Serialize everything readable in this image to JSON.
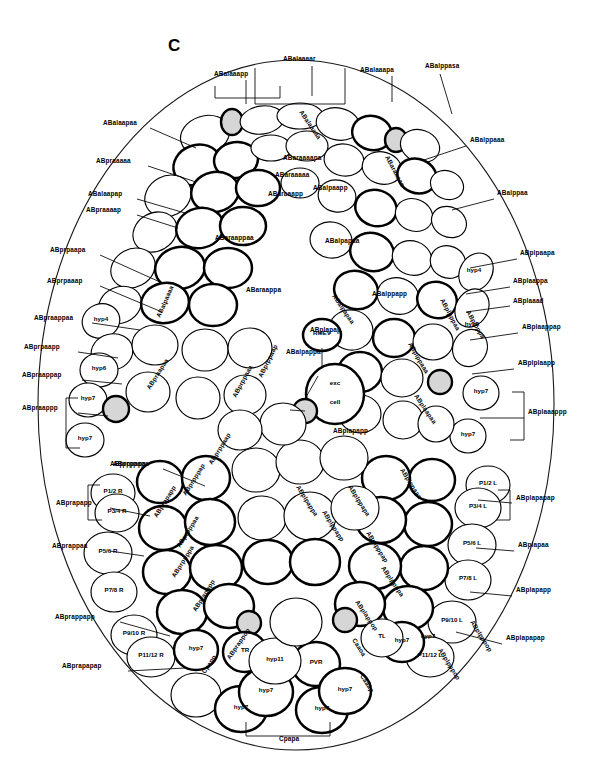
{
  "figure": {
    "panel_letter": "C",
    "colors": {
      "background": "#ffffff",
      "cell_fill": "#ffffff",
      "cell_outline": "#000000",
      "shaded_cell_fill": "#d6d6d6",
      "body_outline": "#1a1a1a"
    },
    "body_outline": {
      "cx": 296,
      "cy": 405,
      "rx": 258,
      "ry": 345
    }
  },
  "outer_labels_left": [
    {
      "text": "ABalaapaa",
      "x": 103,
      "y": 125
    },
    {
      "text": "ABpraaaaa",
      "x": 96,
      "y": 163
    },
    {
      "text": "ABalaapap",
      "x": 88,
      "y": 196
    },
    {
      "text": "ABpraaaap",
      "x": 86,
      "y": 212
    },
    {
      "text": "ABprpaapa",
      "x": 50,
      "y": 252
    },
    {
      "text": "ABprpaaap",
      "x": 47,
      "y": 283
    },
    {
      "text": "ABpraappaa",
      "x": 34,
      "y": 320
    },
    {
      "text": "ABprpaapp",
      "x": 24,
      "y": 349
    },
    {
      "text": "ABpraappap",
      "x": 22,
      "y": 377
    },
    {
      "text": "ABpraappp",
      "x": 22,
      "y": 410
    },
    {
      "text": "ABprppapa",
      "x": 110,
      "y": 466
    },
    {
      "text": "ABprapapp",
      "x": 56,
      "y": 505
    },
    {
      "text": "ABprappaa",
      "x": 52,
      "y": 548
    },
    {
      "text": "ABprappapp",
      "x": 55,
      "y": 619
    },
    {
      "text": "ABprapapap",
      "x": 62,
      "y": 668
    }
  ],
  "outer_labels_right": [
    {
      "text": "ABalppaaa",
      "x": 470,
      "y": 142
    },
    {
      "text": "ABalppaa",
      "x": 497,
      "y": 195
    },
    {
      "text": "ABplpaapa",
      "x": 520,
      "y": 255
    },
    {
      "text": "ABplaappa",
      "x": 513,
      "y": 283
    },
    {
      "text": "ABplaaad",
      "x": 513,
      "y": 303
    },
    {
      "text": "ABplaappap",
      "x": 522,
      "y": 329
    },
    {
      "text": "ABplplaapp",
      "x": 518,
      "y": 365
    },
    {
      "text": "ABplaaappp",
      "x": 528,
      "y": 414
    },
    {
      "text": "ABplapapap",
      "x": 516,
      "y": 500
    },
    {
      "text": "ABplapaa",
      "x": 518,
      "y": 547
    },
    {
      "text": "ABplapapp",
      "x": 516,
      "y": 592
    },
    {
      "text": "ABplapapap",
      "x": 506,
      "y": 640
    }
  ],
  "outer_labels_top": [
    {
      "text": "ABalaaapp",
      "x": 214,
      "y": 76
    },
    {
      "text": "ABalaaaar",
      "x": 283,
      "y": 61
    },
    {
      "text": "ABalaaapa",
      "x": 360,
      "y": 72
    },
    {
      "text": "ABalppasa",
      "x": 425,
      "y": 68
    }
  ],
  "inner_cell_labels": [
    {
      "text": "RMEV",
      "x": 322,
      "y": 335
    },
    {
      "text": "exc",
      "x": 335,
      "y": 385
    },
    {
      "text": "cell",
      "x": 335,
      "y": 404
    },
    {
      "text": "hyp4",
      "x": 101,
      "y": 321
    },
    {
      "text": "hyp6",
      "x": 99,
      "y": 370
    },
    {
      "text": "hyp7",
      "x": 88,
      "y": 400
    },
    {
      "text": "hyp7",
      "x": 85,
      "y": 440
    },
    {
      "text": "hyp4",
      "x": 474,
      "y": 272
    },
    {
      "text": "hyp6",
      "x": 472,
      "y": 326
    },
    {
      "text": "hyp7",
      "x": 481,
      "y": 393
    },
    {
      "text": "hyp7",
      "x": 468,
      "y": 436
    },
    {
      "text": "P1/2 R",
      "x": 113,
      "y": 493
    },
    {
      "text": "P3/4 R",
      "x": 117,
      "y": 513
    },
    {
      "text": "P5/6 R",
      "x": 108,
      "y": 553
    },
    {
      "text": "P7/8 R",
      "x": 114,
      "y": 592
    },
    {
      "text": "P9/10 R",
      "x": 134,
      "y": 635
    },
    {
      "text": "P11/12 R",
      "x": 151,
      "y": 657
    },
    {
      "text": "P1/2 L",
      "x": 488,
      "y": 485
    },
    {
      "text": "P3/4 L",
      "x": 478,
      "y": 508
    },
    {
      "text": "P5/6 L",
      "x": 472,
      "y": 545
    },
    {
      "text": "P7/8 L",
      "x": 468,
      "y": 580
    },
    {
      "text": "P9/10 L",
      "x": 452,
      "y": 622
    },
    {
      "text": "P11/12 L",
      "x": 430,
      "y": 657
    },
    {
      "text": "TR",
      "x": 245,
      "y": 652
    },
    {
      "text": "TL",
      "x": 382,
      "y": 638
    },
    {
      "text": "PVR",
      "x": 316,
      "y": 664
    },
    {
      "text": "hyp11",
      "x": 275,
      "y": 661
    },
    {
      "text": "hyp7",
      "x": 196,
      "y": 650
    },
    {
      "text": "hyp7",
      "x": 266,
      "y": 692
    },
    {
      "text": "hyp7",
      "x": 241,
      "y": 709
    },
    {
      "text": "hyp7",
      "x": 322,
      "y": 710
    },
    {
      "text": "hyp7",
      "x": 345,
      "y": 691
    },
    {
      "text": "hyp7",
      "x": 402,
      "y": 642
    },
    {
      "text": "hyp7",
      "x": 428,
      "y": 638
    }
  ],
  "diagonal_labels": [
    {
      "text": "ABalaaaaa",
      "x": 299,
      "y": 112,
      "rot": 56
    },
    {
      "text": "ABaraaaaa",
      "x": 385,
      "y": 157,
      "rot": 62
    },
    {
      "text": "ABalpaaaa",
      "x": 160,
      "y": 318,
      "rot": -66
    },
    {
      "text": "ABpraapaa",
      "x": 150,
      "y": 390,
      "rot": -58
    },
    {
      "text": "ABprppaaa",
      "x": 236,
      "y": 398,
      "rot": -62
    },
    {
      "text": "ABprppaap",
      "x": 262,
      "y": 378,
      "rot": -64
    },
    {
      "text": "ABalpapaa",
      "x": 332,
      "y": 296,
      "rot": 56
    },
    {
      "text": "ABplppaaa",
      "x": 408,
      "y": 344,
      "rot": 60
    },
    {
      "text": "ABplpppaa",
      "x": 440,
      "y": 300,
      "rot": 62
    },
    {
      "text": "ABplpppa",
      "x": 466,
      "y": 312,
      "rot": 60
    },
    {
      "text": "ABplaapaa",
      "x": 414,
      "y": 396,
      "rot": 56
    },
    {
      "text": "ABprppaap",
      "x": 212,
      "y": 465,
      "rot": -58
    },
    {
      "text": "ABprpppap",
      "x": 186,
      "y": 496,
      "rot": -58
    },
    {
      "text": "ABprppapp",
      "x": 157,
      "y": 518,
      "rot": -58
    },
    {
      "text": "ABprpppaa",
      "x": 180,
      "y": 548,
      "rot": -58
    },
    {
      "text": "ABprppppa",
      "x": 175,
      "y": 578,
      "rot": -58
    },
    {
      "text": "ABprapppp",
      "x": 196,
      "y": 612,
      "rot": -58
    },
    {
      "text": "ABplpappa",
      "x": 296,
      "y": 487,
      "rot": 58
    },
    {
      "text": "ABplppapp",
      "x": 322,
      "y": 512,
      "rot": 58
    },
    {
      "text": "ABplppapa",
      "x": 348,
      "y": 487,
      "rot": 58
    },
    {
      "text": "ABplppaaa",
      "x": 400,
      "y": 470,
      "rot": 58
    },
    {
      "text": "ABplpppap",
      "x": 366,
      "y": 533,
      "rot": 58
    },
    {
      "text": "ABplppppa",
      "x": 381,
      "y": 568,
      "rot": 56
    },
    {
      "text": "ABplappop",
      "x": 355,
      "y": 602,
      "rot": 56
    },
    {
      "text": "ABplpppop",
      "x": 438,
      "y": 650,
      "rot": 58
    },
    {
      "text": "ABprappop",
      "x": 230,
      "y": 660,
      "rot": -56
    },
    {
      "text": "Cpapp",
      "x": 205,
      "y": 674,
      "rot": -56
    },
    {
      "text": "Caaoa",
      "x": 352,
      "y": 640,
      "rot": 58
    },
    {
      "text": "Caaap",
      "x": 360,
      "y": 676,
      "rot": 58
    },
    {
      "text": "ABplpppop",
      "x": 470,
      "y": 622,
      "rot": 58
    }
  ],
  "mid_labels": [
    {
      "text": "ABaraaaapa",
      "x": 283,
      "y": 160
    },
    {
      "text": "ABaraaaaa",
      "x": 275,
      "y": 177
    },
    {
      "text": "ABaraaapp",
      "x": 268,
      "y": 196
    },
    {
      "text": "ABalpaapp",
      "x": 313,
      "y": 190
    },
    {
      "text": "ABaraappaa",
      "x": 215,
      "y": 240
    },
    {
      "text": "ABaraappa",
      "x": 246,
      "y": 292
    },
    {
      "text": "ABalpapaa",
      "x": 325,
      "y": 243
    },
    {
      "text": "ABalppapp",
      "x": 372,
      "y": 296
    },
    {
      "text": "ABalpappa",
      "x": 286,
      "y": 354
    },
    {
      "text": "ABplapapp",
      "x": 333,
      "y": 433
    },
    {
      "text": "ABplapap",
      "x": 310,
      "y": 332
    },
    {
      "text": "ABprppapa",
      "x": 113,
      "y": 466
    },
    {
      "text": "Cpapa",
      "x": 279,
      "y": 741
    }
  ],
  "bottom_label": {
    "text": "Cpapa",
    "x": 279,
    "y": 741
  }
}
